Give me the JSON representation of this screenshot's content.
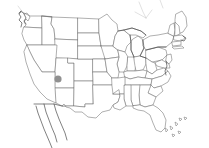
{
  "figure": {
    "type": "locator-map",
    "width": 209,
    "height": 148,
    "background_color": "#ffffff",
    "has_labels": false,
    "has_legend": false,
    "has_axes": false,
    "has_graticule": false
  },
  "style": {
    "state_border_color": "#6e6e6e",
    "coastline_color": "#4a4a4a",
    "faint_border_color": "#c3c3c3",
    "land_fill_color": "#ffffff",
    "marker_color": "#909090"
  },
  "markers": [
    {
      "name": "location-dot",
      "shape": "circle",
      "color": "#909090",
      "x": 58,
      "y": 79,
      "radius": 3.6,
      "region": "Utah"
    }
  ],
  "regions": {
    "extent": "contiguous United States",
    "includes_neighbors": [
      "Baja California peninsula",
      "northern Mexico border",
      "southern Canada border"
    ],
    "water_features": [
      "Great Lakes",
      "Gulf of Mexico",
      "Atlantic Ocean",
      "Pacific Ocean"
    ],
    "detail_features": [
      "Florida Keys",
      "Long Island",
      "Cape Cod",
      "Chesapeake Bay",
      "Puget Sound"
    ]
  },
  "chart_data": {
    "type": "map",
    "title": "",
    "xlabel": "",
    "ylabel": "",
    "projection": "albers-like equal area",
    "series": [
      {
        "name": "marked-location",
        "points": [
          {
            "label": "Utah",
            "x": 58,
            "y": 79,
            "value": 1
          }
        ]
      }
    ],
    "legend_position": "none",
    "grid": false
  }
}
